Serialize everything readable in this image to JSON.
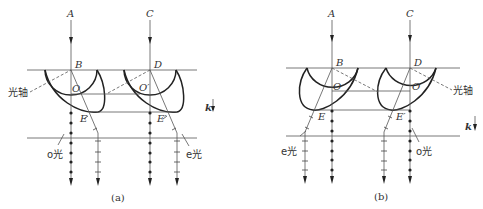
{
  "figure": {
    "panels": [
      {
        "id": "a",
        "caption": "(a)",
        "labels": {
          "A": "A",
          "C": "C",
          "B": "B",
          "D": "D",
          "O": "O",
          "O2": "O′",
          "E": "E",
          "E2": "E′",
          "optic_axis": "光轴",
          "o_ray": "o光",
          "e_ray": "e光",
          "k": "k"
        }
      },
      {
        "id": "b",
        "caption": "(b)",
        "labels": {
          "A": "A",
          "C": "C",
          "B": "B",
          "D": "D",
          "O": "O",
          "O2": "O′",
          "E": "E",
          "E2": "E′",
          "optic_axis": "光轴",
          "o_ray": "o光",
          "e_ray": "e光",
          "k": "k"
        }
      }
    ]
  }
}
